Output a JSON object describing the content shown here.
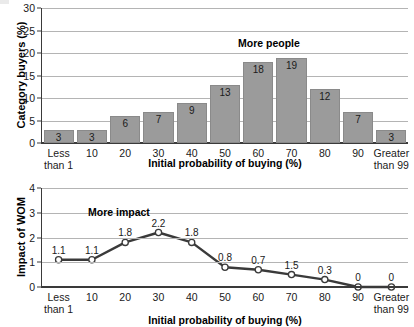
{
  "figure": {
    "background": "#ffffff",
    "bar_color": "#9b9b9b",
    "line_color": "#3a3a3a",
    "marker_fill": "#ffffff",
    "grid_color": "#b4b4b4",
    "axis_color": "#3a3a3a"
  },
  "shared": {
    "xlabel": "Initial probability of buying (%)",
    "xtick_labels": [
      {
        "line1": "Less",
        "line2": "than 1"
      },
      {
        "line1": "10",
        "line2": ""
      },
      {
        "line1": "20",
        "line2": ""
      },
      {
        "line1": "30",
        "line2": ""
      },
      {
        "line1": "40",
        "line2": ""
      },
      {
        "line1": "50",
        "line2": ""
      },
      {
        "line1": "60",
        "line2": ""
      },
      {
        "line1": "70",
        "line2": ""
      },
      {
        "line1": "80",
        "line2": ""
      },
      {
        "line1": "90",
        "line2": ""
      },
      {
        "line1": "Greater",
        "line2": "than 99"
      }
    ]
  },
  "chart_data": [
    {
      "type": "bar",
      "title": "",
      "annotation": "More people",
      "xlabel": "Initial probability of buying (%)",
      "ylabel": "Category buyers (%)",
      "categories": [
        "Less than 1",
        "10",
        "20",
        "30",
        "40",
        "50",
        "60",
        "70",
        "80",
        "90",
        "Greater than 99"
      ],
      "values": [
        3,
        3,
        6,
        7,
        9,
        13,
        18,
        19,
        12,
        7,
        3
      ],
      "data_labels": [
        "3",
        "3",
        "6",
        "7",
        "9",
        "13",
        "18",
        "19",
        "12",
        "7",
        "3"
      ],
      "ylim": [
        0,
        30
      ],
      "yticks": [
        0,
        5,
        10,
        15,
        20,
        25,
        30
      ],
      "ytick_labels": [
        "0",
        "5",
        "10",
        "15",
        "20",
        "25",
        "30"
      ],
      "grid": true,
      "legend": "none"
    },
    {
      "type": "line",
      "title": "",
      "annotation": "More impact",
      "xlabel": "Initial probability of buying (%)",
      "ylabel": "Impact of WOM",
      "categories": [
        "Less than 1",
        "10",
        "20",
        "30",
        "40",
        "50",
        "60",
        "70",
        "80",
        "90",
        "Greater than 99"
      ],
      "values": [
        1.1,
        1.1,
        1.8,
        2.2,
        1.8,
        0.8,
        0.7,
        0.5,
        0.3,
        0,
        0
      ],
      "data_labels": [
        "1.1",
        "1.1",
        "1.8",
        "2.2",
        "1.8",
        "0.8",
        "0.7",
        "1.5",
        "0.3",
        "0",
        "0"
      ],
      "ylim": [
        0,
        4
      ],
      "yticks": [
        0,
        1,
        2,
        3,
        4
      ],
      "ytick_labels": [
        "0",
        "1",
        "2",
        "3",
        "4"
      ],
      "grid": true,
      "legend": "none",
      "markers": "open-circle"
    }
  ]
}
